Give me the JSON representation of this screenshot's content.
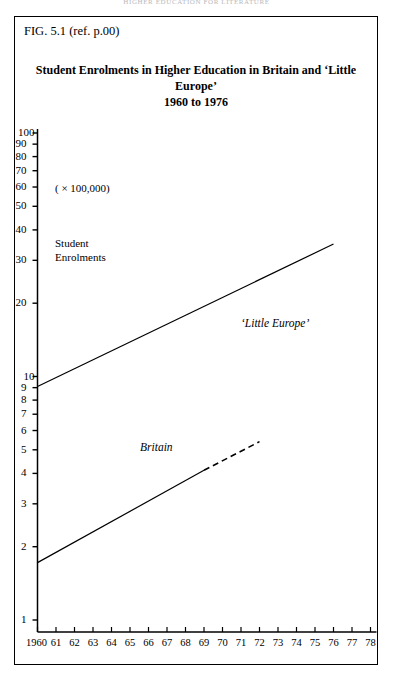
{
  "running_head": "HIGHER EDUCATION FOR LITERATURE",
  "figure": {
    "label": "FIG. 5.1 (ref. p.00)",
    "title_line1": "Student Enrolments in Higher Education in Britain and ‘Little Europe’",
    "title_line2": "1960 to 1976"
  },
  "annotations": {
    "multiplier": "( × 100,000)",
    "axis_caption_line1": "Student",
    "axis_caption_line2": "Enrolments"
  },
  "chart_data": {
    "type": "scatter",
    "title": "Student Enrolments in Higher Education in Britain and ‘Little Europe’ 1960 to 1976",
    "xlabel": "",
    "ylabel": "Student Enrolments",
    "yunit": "( × 100,000)",
    "yscale": "log",
    "ylim": [
      1,
      100
    ],
    "grid": false,
    "legend": "inline-labels",
    "ytick_labels": [
      "1",
      "2",
      "3",
      "4",
      "5",
      "6",
      "7",
      "8",
      "9",
      "10",
      "20",
      "30",
      "40",
      "50",
      "60",
      "70",
      "80",
      "90",
      "100"
    ],
    "ytick_values": [
      1,
      2,
      3,
      4,
      5,
      6,
      7,
      8,
      9,
      10,
      20,
      30,
      40,
      50,
      60,
      70,
      80,
      90,
      100
    ],
    "xtick_labels": [
      "1960",
      "61",
      "62",
      "63",
      "64",
      "65",
      "66",
      "67",
      "68",
      "69",
      "70",
      "71",
      "72",
      "73",
      "74",
      "75",
      "76",
      "77",
      "78"
    ],
    "xtick_values": [
      1960,
      1961,
      1962,
      1963,
      1964,
      1965,
      1966,
      1967,
      1968,
      1969,
      1970,
      1971,
      1972,
      1973,
      1974,
      1975,
      1976,
      1977,
      1978
    ],
    "xlim": [
      1960,
      1978
    ],
    "series": [
      {
        "name": "‘Little Europe’",
        "marker": "open-circle",
        "color": "#000000",
        "x": [
          1960,
          1961,
          1962,
          1963,
          1964,
          1965,
          1966,
          1967,
          1968,
          1969,
          1970,
          1971,
          1972,
          1973,
          1974,
          1975,
          1976
        ],
        "y": [
          9.3,
          9.6,
          10.6,
          11.5,
          12.2,
          13.6,
          14.3,
          15.6,
          17.4,
          18.3,
          20.3,
          21.8,
          23.6,
          25.5,
          27.4,
          30.5,
          33.8
        ],
        "trend": {
          "style": "solid",
          "x": [
            1960,
            1976
          ],
          "y": [
            9.1,
            35.0
          ]
        }
      },
      {
        "name": "Britain",
        "marker": "filled-circle",
        "color": "#000000",
        "x": [
          1960,
          1961,
          1962,
          1963,
          1964,
          1965,
          1966,
          1967,
          1968,
          1969,
          1970,
          1971,
          1972,
          1973,
          1974,
          1975,
          1976
        ],
        "y": [
          1.78,
          1.92,
          2.1,
          2.32,
          2.5,
          2.98,
          3.28,
          3.62,
          3.98,
          4.15,
          4.3,
          4.45,
          4.55,
          4.62,
          4.78,
          4.9,
          5.0
        ],
        "trend": {
          "style": "solid",
          "x": [
            1960,
            1969
          ],
          "y": [
            1.72,
            4.12
          ]
        },
        "trend_extension": {
          "style": "dashed",
          "x": [
            1969,
            1972
          ],
          "y": [
            4.12,
            5.4
          ]
        }
      }
    ]
  }
}
